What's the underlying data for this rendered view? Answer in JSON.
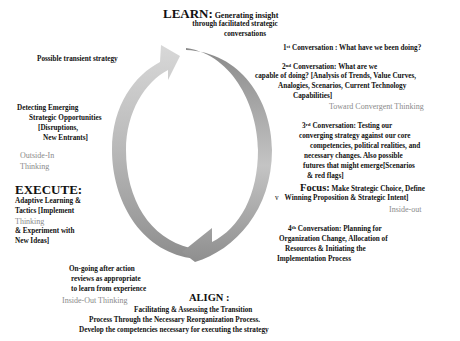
{
  "diagram": {
    "type": "cycle",
    "colors": {
      "arrow_left_light": "#d4d4d4",
      "arrow_left_dark": "#9a9a9a",
      "arrow_right_dark": "#8c8c8c",
      "arrow_right_light": "#d0d0d0",
      "gray_text": "#8a8a8a"
    }
  },
  "learn": {
    "title": "LEARN:",
    "line1": "Generating insight",
    "line2": "through facilitated strategic",
    "line3": "conversations"
  },
  "transient": "Possible transient strategy",
  "conv1": {
    "num": "1",
    "sup": "st",
    "text": " Conversation : What have we been doing?"
  },
  "conv2": {
    "num": "2",
    "sup": "nd",
    "line1": " Conversation: What are we",
    "line2": "capable of doing? [Analysis of Trends, Value Curves,",
    "line3": "Analogies, Scenarios, Current Technology",
    "line4": "Capabilities]"
  },
  "convergent": "Toward Convergent Thinking",
  "detecting": {
    "line1": "Detecting Emerging",
    "line2": "Strategic Opportunities",
    "line3": "[Disruptions,",
    "line4": "New Entrants]"
  },
  "outside_in": {
    "line1": "Outside-In",
    "line2": "Thinking"
  },
  "conv3": {
    "num": "3",
    "sup": "rd",
    "line1": " Conversation: Testing our",
    "line2": "converging strategy against our core",
    "line3": "competencies, political realities, and",
    "line4": "necessary changes. Also possible",
    "line5": "futures that might emerge[Scenarios",
    "line6": "&  red flags]"
  },
  "execute": {
    "title": "EXECUTE:",
    "line1": "Adaptive Learning &",
    "line2": "Tactics  [Implement",
    "line3_gray": "Thinking",
    "line4": "& Experiment with",
    "line5": "New Ideas]"
  },
  "focus": {
    "title": "Focus:",
    "line1": " Make Strategic Choice, Define",
    "bullet": "v",
    "line2": "Winning Proposition & Strategic Intent]"
  },
  "inside_out_right": "Inside-out",
  "conv4": {
    "num": "4",
    "sup": "th",
    "line1": " Conversation:  Planning for",
    "line2": "Organization Change, Allocation of",
    "line3": "Resources & Initiating the",
    "line4": "Implementation Process"
  },
  "ongoing": {
    "line1": "On-going after action",
    "line2": "reviews as appropriate",
    "line3": "to learn from experience"
  },
  "inside_out_left": "Inside-Out Thinking",
  "align": {
    "title": "ALIGN :",
    "line1": "Facilitating & Assessing the Transition",
    "line2": "Process Through the Necessary Reorganization Process.",
    "line3": "Develop the competencies necessary for executing the strategy"
  }
}
